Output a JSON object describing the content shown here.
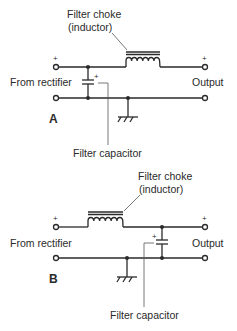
{
  "diagrams": [
    {
      "id": "A",
      "label": "A",
      "choke_label_line1": "Filter choke",
      "choke_label_line2": "(inductor)",
      "input_label": "From rectifier",
      "output_label": "Output",
      "capacitor_label": "Filter capacitor",
      "plus_in": "+",
      "plus_out": "+",
      "plus_cap": "+",
      "topology": "capacitor-input filter (capacitor before choke)"
    },
    {
      "id": "B",
      "label": "B",
      "choke_label_line1": "Filter choke",
      "choke_label_line2": "(inductor)",
      "input_label": "From rectifier",
      "output_label": "Output",
      "capacitor_label": "Filter capacitor",
      "plus_in": "+",
      "plus_out": "+",
      "plus_cap": "+",
      "topology": "choke-input filter (choke before capacitor)"
    }
  ],
  "colors": {
    "line": "#2a2a2a",
    "background": "#ffffff"
  }
}
